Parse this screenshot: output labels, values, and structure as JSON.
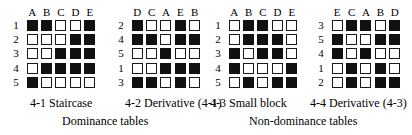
{
  "figure": {
    "matrices": [
      {
        "id": "4-1",
        "name": "staircase-matrix",
        "column_labels": [
          "A",
          "B",
          "C",
          "D",
          "E"
        ],
        "row_labels": [
          "1",
          "2",
          "3",
          "4",
          "5"
        ],
        "cells": [
          [
            1,
            1,
            0,
            0,
            1
          ],
          [
            0,
            0,
            0,
            1,
            1
          ],
          [
            0,
            0,
            1,
            1,
            1
          ],
          [
            0,
            1,
            1,
            1,
            1
          ],
          [
            1,
            0,
            0,
            0,
            0
          ]
        ]
      },
      {
        "id": "4-2",
        "name": "derivative-of-staircase-matrix",
        "column_labels": [
          "D",
          "C",
          "A",
          "E",
          "B"
        ],
        "row_labels": [
          "2",
          "4",
          "5",
          "1",
          "3"
        ],
        "cells": [
          [
            1,
            0,
            0,
            1,
            0
          ],
          [
            1,
            1,
            0,
            1,
            1
          ],
          [
            0,
            0,
            1,
            0,
            0
          ],
          [
            0,
            0,
            1,
            1,
            1
          ],
          [
            1,
            1,
            0,
            1,
            0
          ]
        ]
      },
      {
        "id": "4-3",
        "name": "small-block-matrix",
        "column_labels": [
          "A",
          "B",
          "C",
          "D",
          "E"
        ],
        "row_labels": [
          "1",
          "2",
          "3",
          "4",
          "5"
        ],
        "cells": [
          [
            0,
            1,
            1,
            0,
            0
          ],
          [
            0,
            1,
            1,
            1,
            0
          ],
          [
            1,
            0,
            1,
            1,
            0
          ],
          [
            1,
            0,
            0,
            0,
            1
          ],
          [
            0,
            1,
            0,
            1,
            1
          ]
        ]
      },
      {
        "id": "4-4",
        "name": "derivative-of-small-block-matrix",
        "column_labels": [
          "E",
          "C",
          "A",
          "B",
          "D"
        ],
        "row_labels": [
          "3",
          "5",
          "4",
          "1",
          "2"
        ],
        "cells": [
          [
            0,
            1,
            1,
            0,
            1
          ],
          [
            1,
            0,
            0,
            1,
            1
          ],
          [
            1,
            0,
            1,
            0,
            0
          ],
          [
            0,
            1,
            0,
            1,
            0
          ],
          [
            0,
            1,
            0,
            1,
            1
          ]
        ]
      }
    ],
    "captions": {
      "item_1": "4-1 Staircase",
      "item_2": "4-2 Derivative (4-1)",
      "item_3": "4-3 Small block",
      "item_4": "4-4 Derivative (4-3)",
      "group_left": "Dominance tables",
      "group_right": "Non-dominance tables"
    }
  }
}
